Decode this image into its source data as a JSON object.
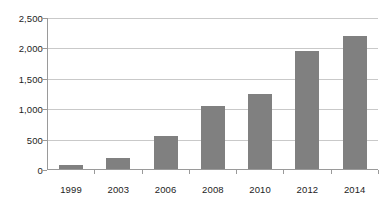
{
  "chart_data": {
    "type": "bar",
    "title": "",
    "subtitle": "",
    "xlabel": "",
    "ylabel": "",
    "categories": [
      "1999",
      "2003",
      "2006",
      "2008",
      "2010",
      "2012",
      "2014"
    ],
    "values": [
      60,
      175,
      545,
      1050,
      1250,
      1960,
      2200
    ],
    "series": [
      {
        "name": "",
        "values": [
          60,
          175,
          545,
          1050,
          1250,
          1960,
          2200
        ]
      }
    ],
    "ylim": [
      0,
      2500
    ],
    "ytick_values": [
      0,
      500,
      1000,
      1500,
      2000,
      2500
    ],
    "ytick_labels": [
      "0",
      "500",
      "1,000",
      "1,500",
      "2,000",
      "2,500"
    ],
    "grid": true,
    "grid_axis": "y",
    "legend": false,
    "legend_position": "none",
    "bar_color": "#808080",
    "gridline_color": "#c9c9c9",
    "axis_color": "#9a9a9a",
    "text_color": "#1d1d1d",
    "background_color": "#ffffff"
  }
}
